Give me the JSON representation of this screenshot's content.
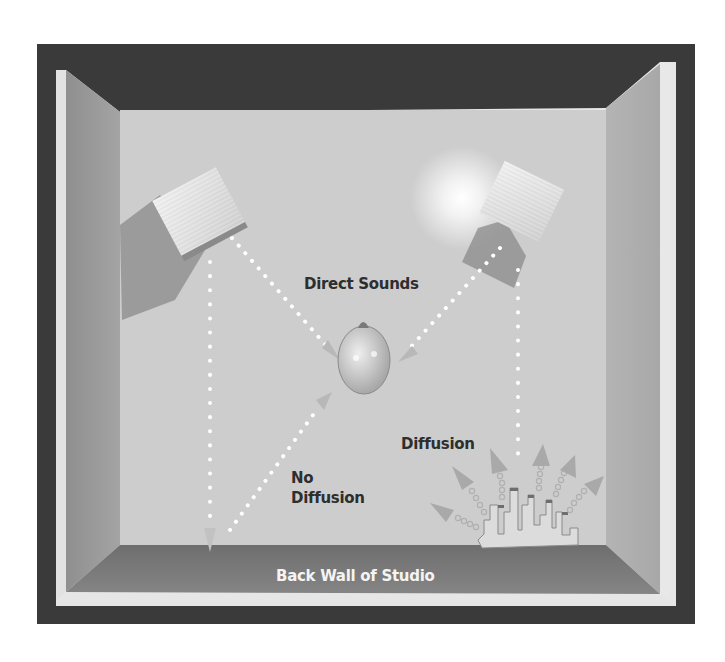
{
  "diagram": {
    "labels": {
      "direct_sounds": "Direct Sounds",
      "no_diffusion_line1": "No",
      "no_diffusion_line2": "Diffusion",
      "diffusion": "Diffusion",
      "back_wall": "Back Wall of Studio"
    },
    "elements": [
      {
        "id": "left-speaker",
        "kind": "speaker"
      },
      {
        "id": "right-speaker",
        "kind": "speaker"
      },
      {
        "id": "listener-head",
        "kind": "listener"
      },
      {
        "id": "diffuser",
        "kind": "acoustic-diffuser"
      }
    ],
    "paths": [
      {
        "from": "left-speaker",
        "to": "listener-head",
        "type": "direct"
      },
      {
        "from": "right-speaker",
        "to": "listener-head",
        "type": "direct"
      },
      {
        "from": "left-speaker",
        "to": "back-wall",
        "type": "reflection-no-diffusion"
      },
      {
        "from": "back-wall",
        "to": "listener-head",
        "type": "reflection-no-diffusion"
      },
      {
        "from": "right-speaker",
        "to": "diffuser",
        "type": "reflection-diffusion"
      }
    ],
    "colors": {
      "outer_frame": "#3a3a3a",
      "inner_frame": "#e6e6e6",
      "back_wall_face": "#cfcfcf",
      "side_wall": "#9c9c9c",
      "floor_band": "#7a7a7a",
      "label_dark": "#2e2e2e",
      "label_light": "#f4f4f4"
    }
  }
}
